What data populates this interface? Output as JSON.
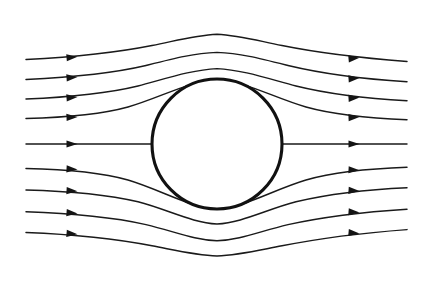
{
  "figure": {
    "title": "Streamline flow past a circular cylinder",
    "type": "line-diagram",
    "width": 433,
    "height": 285,
    "background_color": "#ffffff",
    "line_color": "#1a1a1a",
    "obstacle_color": "#111111"
  },
  "obstacle": {
    "name": "cylinder",
    "shape": "circle",
    "cx": 217,
    "cy": 144,
    "r": 65,
    "stroke_width": 3.1,
    "fill": "#ffffff"
  },
  "flow": {
    "direction": "left-to-right",
    "streamline_count": 9,
    "x_start": 26,
    "x_end": 407,
    "left_arrow_x": 72,
    "right_arrow_x": 354,
    "arrow_length": 11,
    "arrow_halfwidth": 3.6,
    "inlet_y": [
      58,
      78,
      98,
      118,
      144,
      168,
      190,
      212,
      233
    ],
    "outlet_y": [
      62,
      82,
      101,
      120,
      144,
      167,
      188,
      209,
      230
    ],
    "apex_y": [
      34,
      52,
      68,
      78,
      144,
      210,
      224,
      241,
      256
    ],
    "streamlines": [
      {
        "id": "streamline-1",
        "side": "upper",
        "inlet_y": 58,
        "outlet_y": 62,
        "apex_y": 34,
        "path": "M 26,59.5 C 70,57.2 112,53.5 152,45.5 C 180,39.8 196,35.2 217,34.2 C 238,35.2 254,39.8 282,45.5 C 322,53.6 364,58.2 407,61.5"
      },
      {
        "id": "streamline-2",
        "side": "upper",
        "inlet_y": 78,
        "outlet_y": 82,
        "apex_y": 52,
        "path": "M 26,79.5 C 68,77.5 108,74.5 146,65.5 C 175,58.2 194,53.3 217,52.4 C 240,53.3 259,58.2 288,65.5 C 326,74.6 366,79.2 407,81.8"
      },
      {
        "id": "streamline-3",
        "side": "upper",
        "inlet_y": 98,
        "outlet_y": 101,
        "apex_y": 68,
        "path": "M 26,99.0 C 66,97.4 104,94.3 138,86.0 C 168,78.0 192,69.8 217,68.6 C 242,69.8 266,78.0 296,86.0 C 330,94.4 368,98.6 407,100.8"
      },
      {
        "id": "streamline-4",
        "side": "upper",
        "inlet_y": 118,
        "outlet_y": 120,
        "apex_y": 79,
        "path": "M 26,118.5 C 64,117.5 100,114.8 128,107.0 C 160,97.8 190,80.8 217,79.4 C 244,80.8 274,97.8 306,107.0 C 334,114.8 370,118.3 407,119.8"
      },
      {
        "id": "streamline-5-stagnation",
        "side": "center",
        "inlet_y": 144,
        "outlet_y": 144,
        "apex_y": 144,
        "path": "M 26,144 L 152,144 M 282,144 L 407,144"
      },
      {
        "id": "streamline-6",
        "side": "lower",
        "inlet_y": 168,
        "outlet_y": 167,
        "apex_y": 210,
        "path": "M 26,168.5 C 64,169.3 100,172.0 128,180.0 C 160,189.5 190,207.6 217,209.2 C 244,207.6 274,189.5 306,180.0 C 334,172.0 370,168.6 407,167.3"
      },
      {
        "id": "streamline-7",
        "side": "lower",
        "inlet_y": 190,
        "outlet_y": 188,
        "apex_y": 224,
        "path": "M 26,190.0 C 66,191.0 104,193.8 138,201.8 C 168,209.6 192,222.8 217,224.0 C 242,222.8 266,209.6 296,201.8 C 330,193.8 368,189.6 407,187.8"
      },
      {
        "id": "streamline-8",
        "side": "lower",
        "inlet_y": 212,
        "outlet_y": 209,
        "apex_y": 241,
        "path": "M 26,211.8 C 68,213.2 108,216.2 146,224.6 C 175,231.6 194,240.0 217,240.8 C 240,240.0 259,231.6 288,224.6 C 326,216.2 366,211.8 407,209.2"
      },
      {
        "id": "streamline-9",
        "side": "lower",
        "inlet_y": 233,
        "outlet_y": 230,
        "apex_y": 256,
        "path": "M 26,232.5 C 70,234.2 112,238.0 152,245.8 C 180,251.2 196,255.2 217,256.0 C 238,255.2 254,251.2 282,245.8 C 322,237.9 364,232.8 407,229.6"
      }
    ],
    "arrows": [
      {
        "id": "arrow-l1",
        "x": 72,
        "y": 56.8,
        "angle": -5.0
      },
      {
        "id": "arrow-l2",
        "x": 72,
        "y": 77.1,
        "angle": -4.4
      },
      {
        "id": "arrow-l3",
        "x": 72,
        "y": 97.1,
        "angle": -3.9
      },
      {
        "id": "arrow-l4",
        "x": 72,
        "y": 116.9,
        "angle": -2.9
      },
      {
        "id": "arrow-l5",
        "x": 72,
        "y": 144.0,
        "angle": 0.0
      },
      {
        "id": "arrow-l6",
        "x": 72,
        "y": 169.5,
        "angle": 2.9
      },
      {
        "id": "arrow-l7",
        "x": 72,
        "y": 191.3,
        "angle": 3.6
      },
      {
        "id": "arrow-l8",
        "x": 72,
        "y": 213.4,
        "angle": 4.4
      },
      {
        "id": "arrow-l9",
        "x": 72,
        "y": 234.3,
        "angle": 5.0
      },
      {
        "id": "arrow-r1",
        "x": 354,
        "y": 57.8,
        "angle": -5.2
      },
      {
        "id": "arrow-r2",
        "x": 354,
        "y": 78.0,
        "angle": -4.6
      },
      {
        "id": "arrow-r3",
        "x": 354,
        "y": 97.6,
        "angle": -4.0
      },
      {
        "id": "arrow-r4",
        "x": 354,
        "y": 117.0,
        "angle": -3.0
      },
      {
        "id": "arrow-r5",
        "x": 354,
        "y": 144.0,
        "angle": 0.0
      },
      {
        "id": "arrow-r6",
        "x": 354,
        "y": 170.3,
        "angle": 3.0
      },
      {
        "id": "arrow-r7",
        "x": 354,
        "y": 191.1,
        "angle": 4.0
      },
      {
        "id": "arrow-r8",
        "x": 354,
        "y": 212.6,
        "angle": 4.6
      },
      {
        "id": "arrow-r9",
        "x": 354,
        "y": 233.5,
        "angle": 5.2
      }
    ]
  }
}
